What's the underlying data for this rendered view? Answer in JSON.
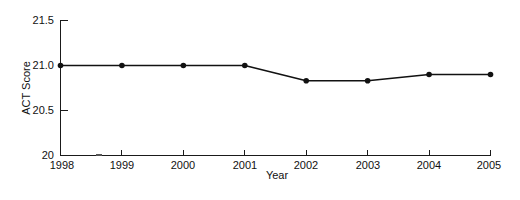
{
  "chart_data": {
    "type": "line",
    "title": "",
    "subtitle": "",
    "xlabel": "Year",
    "ylabel": "ACT Score",
    "x": [
      1998,
      1999,
      2000,
      2001,
      2002,
      2003,
      2004,
      2005
    ],
    "categories": [
      "1998",
      "1999",
      "2000",
      "2001",
      "2002",
      "2003",
      "2004",
      "2005"
    ],
    "values": [
      21.0,
      21.0,
      21.0,
      21.0,
      20.83,
      20.83,
      20.9,
      20.9
    ],
    "series": [
      {
        "name": "ACT Score",
        "values": [
          21.0,
          21.0,
          21.0,
          21.0,
          20.83,
          20.83,
          20.9,
          20.9
        ]
      }
    ],
    "xlim": [
      1998,
      2005
    ],
    "ylim": [
      20,
      21.5
    ],
    "ytick_values": [
      20,
      20.5,
      21.0,
      21.5
    ],
    "ytick_labels": [
      "20",
      "20.5",
      "21.0",
      "21.5"
    ],
    "xtick_values": [
      1998,
      1999,
      2000,
      2001,
      2002,
      2003,
      2004,
      2005
    ],
    "xtick_labels": [
      "1998",
      "1999",
      "2000",
      "2001",
      "2002",
      "2003",
      "2004",
      "2005"
    ],
    "grid": false,
    "legend": false,
    "legend_position": "none",
    "marker": "circle",
    "line_color": "#111111",
    "marker_color": "#111111",
    "axis_color": "#1a1a1a",
    "background_color": "#ffffff",
    "annotations": []
  },
  "axis_titles": {
    "x": "Year",
    "y": "ACT Score"
  },
  "y_labels": {
    "t3": "21.5",
    "t2": "21.0",
    "t1": "20.5",
    "t0": "20"
  },
  "x_labels": {
    "p0": "1998",
    "p1": "1999",
    "p2": "2000",
    "p3": "2001",
    "p4": "2002",
    "p5": "2003",
    "p6": "2004",
    "p7": "2005"
  }
}
